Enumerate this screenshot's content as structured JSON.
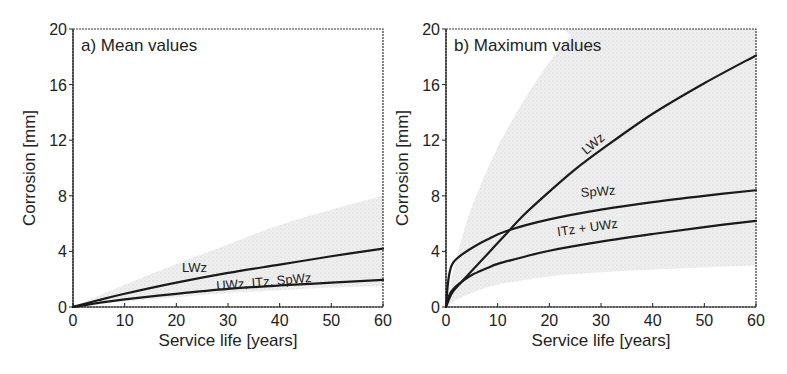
{
  "figure": {
    "width": 787,
    "height": 374
  },
  "chart_data": [
    {
      "type": "line",
      "panel_id": "a",
      "title": "a) Mean values",
      "xlabel": "Service life [years]",
      "ylabel": "Corrosion [mm]",
      "xlim": [
        0,
        60
      ],
      "ylim": [
        0,
        20
      ],
      "xticks": [
        0,
        10,
        20,
        30,
        40,
        50,
        60
      ],
      "yticks": [
        0,
        4,
        8,
        12,
        16,
        20
      ],
      "grid": false,
      "legend": "none (inline curve labels)",
      "plot_box": {
        "x0": 73,
        "y0": 29,
        "x1": 383,
        "y1": 307
      },
      "band": {
        "name": "scatter range",
        "color": "#e4e4e4",
        "upper": {
          "x": [
            0,
            10,
            20,
            30,
            40,
            50,
            60
          ],
          "y": [
            0,
            1.6,
            3.1,
            4.5,
            5.9,
            7.0,
            8.0
          ]
        },
        "lower": {
          "x": [
            0,
            10,
            20,
            30,
            40,
            50,
            60
          ],
          "y": [
            0,
            0.4,
            0.7,
            1.0,
            1.2,
            1.4,
            1.5
          ]
        }
      },
      "series": [
        {
          "name": "LWz",
          "x": [
            0,
            5,
            10,
            20,
            30,
            40,
            50,
            60
          ],
          "y": [
            0,
            0.5,
            0.95,
            1.75,
            2.45,
            3.05,
            3.65,
            4.2
          ],
          "label_pos": {
            "x": 23.5,
            "y": 2.5,
            "rotate": 0
          }
        },
        {
          "name": "UWz, ITz, SpWz",
          "x": [
            0,
            5,
            10,
            20,
            30,
            40,
            50,
            60
          ],
          "y": [
            0,
            0.3,
            0.55,
            0.95,
            1.3,
            1.55,
            1.75,
            1.95
          ],
          "label_pos": {
            "x": 37,
            "y": 1.5,
            "rotate": -5
          }
        }
      ]
    },
    {
      "type": "line",
      "panel_id": "b",
      "title": "b) Maximum values",
      "xlabel": "Service life [years]",
      "ylabel": "Corrosion [mm]",
      "xlim": [
        0,
        60
      ],
      "ylim": [
        0,
        20
      ],
      "xticks": [
        0,
        10,
        20,
        30,
        40,
        50,
        60
      ],
      "yticks": [
        0,
        4,
        8,
        12,
        16,
        20
      ],
      "grid": false,
      "legend": "none (inline curve labels)",
      "plot_box": {
        "x0": 446,
        "y0": 29,
        "x1": 756,
        "y1": 307
      },
      "band": {
        "name": "scatter range",
        "color": "#e6e6e6",
        "upper": {
          "x": [
            0,
            2,
            5,
            10,
            15,
            20,
            24,
            26,
            60
          ],
          "y": [
            0,
            3.5,
            7.2,
            11.5,
            14.8,
            17.6,
            19.4,
            20,
            20
          ]
        },
        "lower": {
          "x": [
            0,
            2,
            5,
            10,
            20,
            30,
            40,
            50,
            60
          ],
          "y": [
            0,
            0.5,
            1.0,
            1.6,
            2.2,
            2.5,
            2.7,
            2.85,
            3.0
          ]
        }
      },
      "series": [
        {
          "name": "LWz",
          "x": [
            0,
            1,
            2,
            3,
            5,
            8,
            10,
            12,
            15,
            20,
            25,
            30,
            40,
            50,
            60
          ],
          "y": [
            0,
            0.9,
            1.4,
            1.8,
            2.6,
            3.8,
            4.6,
            5.4,
            6.6,
            8.3,
            9.9,
            11.3,
            13.9,
            16.1,
            18.1
          ],
          "label_pos": {
            "x": 29,
            "y": 11.5,
            "rotate": -40
          }
        },
        {
          "name": "SpWz",
          "x": [
            0,
            0.3,
            0.6,
            1,
            1.5,
            2,
            3,
            5,
            8,
            12,
            20,
            30,
            40,
            50,
            60
          ],
          "y": [
            0,
            1.4,
            2.3,
            2.9,
            3.25,
            3.45,
            3.75,
            4.25,
            4.85,
            5.5,
            6.3,
            7.0,
            7.55,
            8.0,
            8.4
          ],
          "label_pos": {
            "x": 29.5,
            "y": 8.0,
            "rotate": -4
          }
        },
        {
          "name": "ITz + UWz",
          "x": [
            0,
            0.5,
            1,
            2,
            3,
            5,
            8,
            10,
            15,
            20,
            30,
            40,
            50,
            60
          ],
          "y": [
            0,
            0.7,
            1.1,
            1.5,
            1.8,
            2.3,
            2.8,
            3.1,
            3.6,
            4.05,
            4.7,
            5.25,
            5.75,
            6.2
          ],
          "label_pos": {
            "x": 27.5,
            "y": 5.4,
            "rotate": -8
          }
        }
      ]
    }
  ]
}
